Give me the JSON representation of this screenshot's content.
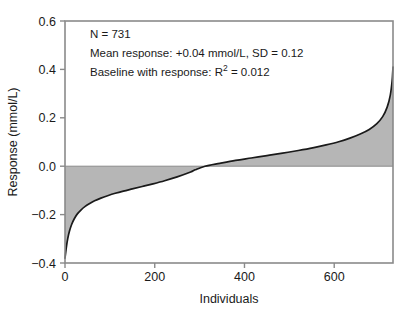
{
  "chart_data": {
    "type": "area",
    "title": "",
    "subtitle": "",
    "xlabel": "Individuals",
    "ylabel": "Response (mmol/L)",
    "xlim": [
      0,
      731
    ],
    "ylim": [
      -0.4,
      0.6
    ],
    "xticks": [
      0,
      200,
      400,
      600
    ],
    "xtick_labels": [
      "0",
      "200",
      "400",
      "600"
    ],
    "yticks": [
      -0.4,
      -0.2,
      0.0,
      0.2,
      0.4,
      0.6
    ],
    "ytick_labels": [
      "-0.4",
      "-0.2",
      "0.0",
      "0.2",
      "0.4",
      "0.6"
    ],
    "grid": false,
    "legend": false,
    "baseline": 0.0,
    "fill_color": "#b6b6b6",
    "line_color": "#1a1a1a",
    "frame_color": "#8a8a8a",
    "zero_crossing_x": 290,
    "series": [
      {
        "name": "Sorted individual response",
        "x": [
          0,
          3,
          6,
          10,
          15,
          21,
          28,
          36,
          45,
          55,
          66,
          80,
          95,
          112,
          130,
          150,
          172,
          196,
          222,
          250,
          280,
          290,
          312,
          345,
          380,
          415,
          450,
          485,
          520,
          552,
          582,
          610,
          635,
          658,
          678,
          695,
          708,
          718,
          725,
          729,
          731
        ],
        "y": [
          -0.38,
          -0.335,
          -0.3,
          -0.268,
          -0.24,
          -0.216,
          -0.196,
          -0.18,
          -0.166,
          -0.154,
          -0.143,
          -0.132,
          -0.122,
          -0.112,
          -0.103,
          -0.094,
          -0.084,
          -0.073,
          -0.06,
          -0.044,
          -0.024,
          -0.015,
          0.0,
          0.012,
          0.024,
          0.034,
          0.044,
          0.054,
          0.065,
          0.076,
          0.088,
          0.101,
          0.116,
          0.133,
          0.152,
          0.176,
          0.205,
          0.244,
          0.294,
          0.352,
          0.41
        ]
      }
    ],
    "annotations": [
      {
        "id": "n-count",
        "text": "N = 731",
        "x": 90,
        "y": 38
      },
      {
        "id": "mean-response",
        "text": "Mean response: +0.04 mmol/L, SD = 0.12",
        "x": 90,
        "y": 57
      },
      {
        "id": "baseline-r2",
        "text_before": "Baseline with response: R",
        "superscript": "2",
        "text_after": " = 0.012",
        "x": 90,
        "y": 76
      }
    ],
    "stats": {
      "n": 731,
      "mean_response": 0.04,
      "mean_response_units": "mmol/L",
      "sd": 0.12,
      "r_squared": 0.012
    }
  }
}
